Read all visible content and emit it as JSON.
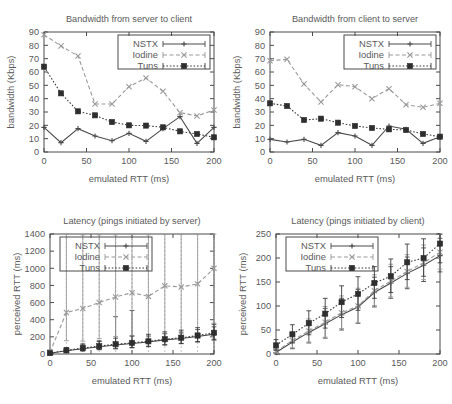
{
  "figure": {
    "panels": [
      "top_left",
      "top_right",
      "bottom_left",
      "bottom_right"
    ]
  },
  "legend": {
    "nstx": "NSTX",
    "iodine": "Iodine",
    "tuns": "Tuns"
  },
  "chart_data": [
    {
      "id": "top_left",
      "type": "line",
      "title": "Bandwidth from server to client",
      "xlabel": "emulated RTT (ms)",
      "ylabel": "bandwidth (Kbps)",
      "xlim": [
        0,
        200
      ],
      "ylim": [
        0,
        90
      ],
      "xticks": [
        0,
        50,
        100,
        150,
        200
      ],
      "yticks": [
        0,
        10,
        20,
        30,
        40,
        50,
        60,
        70,
        80,
        90
      ],
      "xticklabels": [
        "0",
        "50",
        "100",
        "150",
        "200"
      ],
      "yticklabels": [
        "0",
        "10",
        "20",
        "30",
        "40",
        "50",
        "60",
        "70",
        "80",
        "90"
      ],
      "grid": false,
      "legend_position": "top-right",
      "x": [
        0,
        20,
        40,
        60,
        80,
        100,
        120,
        140,
        160,
        180,
        200
      ],
      "series": [
        {
          "name": "NSTX",
          "marker": "plus",
          "linestyle": "solid",
          "values": [
            18.5,
            7.0,
            17.5,
            12.0,
            8.5,
            14.0,
            8.0,
            17.5,
            26.5,
            6.5,
            18.5
          ]
        },
        {
          "name": "Iodine",
          "marker": "cross",
          "linestyle": "dashed",
          "values": [
            88.0,
            79.5,
            72.0,
            36.0,
            36.0,
            49.0,
            55.5,
            45.5,
            29.5,
            27.0,
            31.5
          ]
        },
        {
          "name": "Tuns",
          "marker": "square",
          "linestyle": "dotted",
          "values": [
            64.0,
            44.0,
            30.5,
            27.5,
            22.5,
            20.0,
            19.8,
            18.5,
            15.5,
            13.5,
            11.0
          ]
        }
      ]
    },
    {
      "id": "top_right",
      "type": "line",
      "title": "Bandwidth from client to server",
      "xlabel": "emulated RTT (ms)",
      "ylabel": "bandwidth (Kbps)",
      "xlim": [
        0,
        200
      ],
      "ylim": [
        0,
        90
      ],
      "xticks": [
        0,
        50,
        100,
        150,
        200
      ],
      "yticks": [
        0,
        10,
        20,
        30,
        40,
        50,
        60,
        70,
        80,
        90
      ],
      "xticklabels": [
        "0",
        "50",
        "100",
        "150",
        "200"
      ],
      "yticklabels": [
        "0",
        "10",
        "20",
        "30",
        "40",
        "50",
        "60",
        "70",
        "80",
        "90"
      ],
      "grid": false,
      "legend_position": "top-right",
      "x": [
        0,
        20,
        40,
        60,
        80,
        100,
        120,
        140,
        160,
        180,
        200
      ],
      "series": [
        {
          "name": "NSTX",
          "marker": "plus",
          "linestyle": "solid",
          "values": [
            9.5,
            7.5,
            9.5,
            5.0,
            14.5,
            12.0,
            5.0,
            19.5,
            17.0,
            6.5,
            11.5
          ]
        },
        {
          "name": "Iodine",
          "marker": "cross",
          "linestyle": "dashed",
          "values": [
            68.5,
            69.5,
            51.0,
            37.5,
            50.5,
            49.0,
            40.0,
            47.5,
            35.5,
            33.5,
            36.5
          ]
        },
        {
          "name": "Tuns",
          "marker": "square",
          "linestyle": "dotted",
          "values": [
            36.5,
            34.5,
            24.0,
            25.0,
            22.0,
            19.5,
            18.0,
            17.0,
            16.5,
            13.5,
            11.5
          ]
        }
      ]
    },
    {
      "id": "bottom_left",
      "type": "line",
      "title": "Latency (pings initiated by server)",
      "xlabel": "emulated RTT (ms)",
      "ylabel": "perceived RTT (ms)",
      "xlim": [
        0,
        200
      ],
      "ylim": [
        0,
        1400
      ],
      "xticks": [
        0,
        50,
        100,
        150,
        200
      ],
      "yticks": [
        0,
        200,
        400,
        600,
        800,
        1000,
        1200,
        1400
      ],
      "xticklabels": [
        "0",
        "50",
        "100",
        "150",
        "200"
      ],
      "yticklabels": [
        "0",
        "200",
        "400",
        "600",
        "800",
        "1000",
        "1200",
        "1400"
      ],
      "grid": true,
      "legend_position": "top-left",
      "x": [
        0,
        20,
        40,
        60,
        80,
        100,
        120,
        140,
        160,
        180,
        200
      ],
      "series": [
        {
          "name": "NSTX",
          "marker": "plus",
          "linestyle": "solid",
          "values": [
            8,
            38,
            62,
            85,
            105,
            122,
            140,
            165,
            180,
            205,
            232
          ],
          "err_low": [
            5,
            18,
            28,
            35,
            45,
            50,
            55,
            60,
            60,
            65,
            70
          ],
          "err_high": [
            10,
            30,
            45,
            60,
            330,
            385,
            70,
            75,
            75,
            80,
            85
          ]
        },
        {
          "name": "Iodine",
          "marker": "cross",
          "linestyle": "dashed",
          "values": [
            20,
            485,
            530,
            600,
            665,
            715,
            672,
            795,
            782,
            818,
            1000
          ],
          "err_low": [
            15,
            330,
            380,
            420,
            460,
            500,
            470,
            560,
            545,
            570,
            640
          ],
          "err_high": [
            30,
            915,
            860,
            790,
            725,
            680,
            720,
            600,
            615,
            580,
            400
          ]
        },
        {
          "name": "Tuns",
          "marker": "square",
          "linestyle": "dotted",
          "values": [
            10,
            42,
            70,
            92,
            115,
            130,
            148,
            172,
            190,
            215,
            248
          ],
          "err_low": [
            6,
            20,
            30,
            38,
            48,
            54,
            58,
            64,
            66,
            70,
            76
          ],
          "err_high": [
            12,
            32,
            48,
            62,
            70,
            78,
            82,
            86,
            88,
            92,
            98
          ]
        }
      ]
    },
    {
      "id": "bottom_right",
      "type": "line",
      "title": "Latency (pings initiated by client)",
      "xlabel": "emulated RTT (ms)",
      "ylabel": "perceived RTT (ms)",
      "xlim": [
        0,
        200
      ],
      "ylim": [
        0,
        250
      ],
      "xticks": [
        0,
        50,
        100,
        150,
        200
      ],
      "yticks": [
        0,
        50,
        100,
        150,
        200,
        250
      ],
      "xticklabels": [
        "0",
        "50",
        "100",
        "150",
        "200"
      ],
      "yticklabels": [
        "0",
        "50",
        "100",
        "150",
        "200",
        "250"
      ],
      "grid": false,
      "legend_position": "top-left",
      "x": [
        0,
        20,
        40,
        60,
        80,
        100,
        120,
        140,
        160,
        180,
        200
      ],
      "series": [
        {
          "name": "NSTX",
          "marker": "plus",
          "linestyle": "solid",
          "values": [
            3,
            25,
            45,
            63,
            82,
            98,
            128,
            148,
            168,
            185,
            205
          ],
          "err_low": [
            3,
            14,
            22,
            30,
            32,
            34,
            30,
            32,
            32,
            34,
            34
          ],
          "err_high": [
            5,
            16,
            24,
            32,
            34,
            36,
            32,
            34,
            34,
            36,
            36
          ]
        },
        {
          "name": "Iodine",
          "marker": "cross",
          "linestyle": "dashed",
          "values": [
            6,
            28,
            48,
            66,
            86,
            100,
            132,
            152,
            172,
            190,
            212
          ],
          "err_low": [
            4,
            15,
            23,
            31,
            33,
            35,
            31,
            33,
            33,
            35,
            35
          ],
          "err_high": [
            6,
            17,
            25,
            33,
            35,
            37,
            33,
            35,
            35,
            37,
            37
          ]
        },
        {
          "name": "Tuns",
          "marker": "square",
          "linestyle": "dotted",
          "values": [
            18,
            41,
            64,
            84,
            108,
            125,
            148,
            162,
            191,
            200,
            230
          ],
          "err_low": [
            10,
            18,
            24,
            30,
            32,
            34,
            32,
            34,
            36,
            38,
            40
          ],
          "err_high": [
            12,
            20,
            26,
            32,
            34,
            36,
            34,
            36,
            38,
            40,
            42
          ]
        }
      ]
    }
  ]
}
